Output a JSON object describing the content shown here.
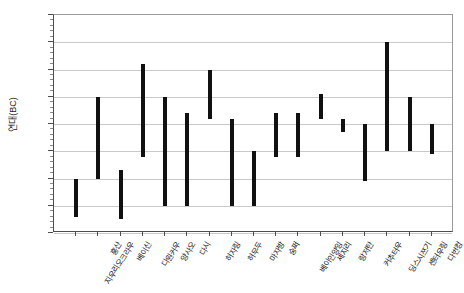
{
  "chart_data": {
    "type": "bar",
    "subtype": "range-bar",
    "title": "",
    "xlabel": "",
    "ylabel": "연대(BC)",
    "ylim": [
      1500,
      5500
    ],
    "y_inverted": true,
    "y_tick_step": 500,
    "y_ticks": [
      1500,
      2000,
      2500,
      3000,
      3500,
      4000,
      4500,
      5000,
      5500
    ],
    "grid": true,
    "legend": false,
    "bar_color": "#111111",
    "categories": [
      "지우리오크라우",
      "훙산",
      "베이신",
      "다원커우",
      "양사오",
      "다시",
      "허자링",
      "허무두",
      "마자방",
      "숭쩌",
      "베이인양잉",
      "셰지리",
      "랑저탄",
      "커추터우",
      "딩스시쯔기",
      "셴터우링",
      "다번컹"
    ],
    "ranges": [
      {
        "category": "지우리오크라우",
        "start": 4500,
        "end": 5200
      },
      {
        "category": "훙산",
        "start": 3000,
        "end": 4500
      },
      {
        "category": "베이신",
        "start": 4350,
        "end": 5250
      },
      {
        "category": "다원커우",
        "start": 2400,
        "end": 4100
      },
      {
        "category": "양사오",
        "start": 3000,
        "end": 5000
      },
      {
        "category": "다시",
        "start": 3300,
        "end": 5000
      },
      {
        "category": "허자링",
        "start": 2500,
        "end": 3400
      },
      {
        "category": "허무두",
        "start": 3400,
        "end": 5000
      },
      {
        "category": "마자방",
        "start": 4000,
        "end": 5000
      },
      {
        "category": "숭쩌",
        "start": 3300,
        "end": 4100
      },
      {
        "category": "베이인양잉",
        "start": 3300,
        "end": 4100
      },
      {
        "category": "셰지리",
        "start": 2950,
        "end": 3400
      },
      {
        "category": "랑저탄",
        "start": 3400,
        "end": 3650
      },
      {
        "category": "커추터우",
        "start": 3500,
        "end": 4550
      },
      {
        "category": "딩스시쯔기",
        "start": 2000,
        "end": 4000
      },
      {
        "category": "셴터우링",
        "start": 3000,
        "end": 4000
      },
      {
        "category": "다번컹",
        "start": 3500,
        "end": 4050
      }
    ]
  }
}
